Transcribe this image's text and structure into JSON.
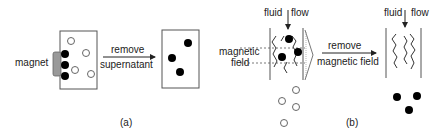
{
  "panel_a": {
    "magnet_label": "magnet",
    "arrow_label_line1": "remove",
    "arrow_label_line2": "supernatant",
    "caption": "(a)"
  },
  "panel_b": {
    "flow_label_left_1": "fluid",
    "flow_label_left_2": "flow",
    "field_label_line1": "magnetic",
    "field_label_line2": "field",
    "arrow_label_line1": "remove",
    "arrow_label_line2": "magnetic field",
    "flow_label_right_1": "fluid",
    "flow_label_right_2": "flow",
    "caption": "(b)"
  },
  "colors": {
    "magnet": "#999999",
    "particle_magnetic": "#000000",
    "particle_nonmagnetic": "#ffffff"
  }
}
